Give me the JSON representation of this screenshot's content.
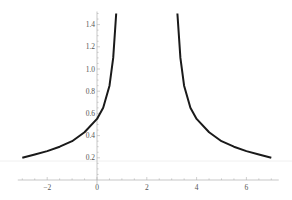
{
  "chart_data": {
    "type": "line",
    "title": "",
    "xlabel": "",
    "ylabel": "",
    "xlim": [
      -3.1,
      7.3
    ],
    "ylim": [
      0,
      1.5
    ],
    "grid": false,
    "legend": null,
    "x_ticks": [
      -2,
      0,
      2,
      4,
      6
    ],
    "x_tick_labels": [
      "−2",
      "0",
      "2",
      "4",
      "6"
    ],
    "y_ticks": [
      0.2,
      0.4,
      0.6,
      0.8,
      1.0,
      1.2,
      1.4
    ],
    "y_tick_labels": [
      "0.2",
      "0.4",
      "0.6",
      "0.8",
      "1.0",
      "1.2",
      "1.4"
    ],
    "vertical_asymptote_x": 2,
    "series": [
      {
        "name": "left branch",
        "color": "#1a1a1a",
        "x": [
          -3.0,
          -2.5,
          -2.0,
          -1.5,
          -1.0,
          -0.5,
          0.0,
          0.25,
          0.5,
          0.65,
          0.77
        ],
        "y": [
          0.2,
          0.23,
          0.26,
          0.3,
          0.35,
          0.43,
          0.55,
          0.65,
          0.85,
          1.1,
          1.5
        ]
      },
      {
        "name": "right branch",
        "color": "#1a1a1a",
        "x": [
          3.23,
          3.35,
          3.5,
          3.75,
          4.0,
          4.5,
          5.0,
          5.5,
          6.0,
          6.5,
          7.0
        ],
        "y": [
          1.5,
          1.1,
          0.85,
          0.65,
          0.55,
          0.43,
          0.35,
          0.3,
          0.26,
          0.23,
          0.2
        ]
      }
    ]
  }
}
